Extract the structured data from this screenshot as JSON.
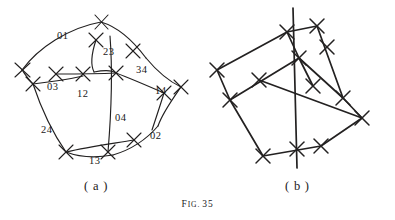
{
  "figure": {
    "caption_prefix": "F",
    "caption_smallcaps": "IG.",
    "caption_number": "35",
    "caption_full": "FIG. 35",
    "background_color": "#ffffff",
    "ink_color": "#222020"
  },
  "panels": [
    {
      "id": "a",
      "subcaption": "( a )",
      "style": "curved-arcs",
      "description": "knot projection drawn with curved arcs and tick-marked crossings",
      "crossing_labels": [
        {
          "text": "01",
          "x": 57,
          "y": 31
        },
        {
          "text": "23",
          "x": 103,
          "y": 47
        },
        {
          "text": "34",
          "x": 136,
          "y": 65
        },
        {
          "text": "03",
          "x": 47,
          "y": 82
        },
        {
          "text": "12",
          "x": 77,
          "y": 89
        },
        {
          "text": "14",
          "x": 155,
          "y": 86
        },
        {
          "text": "04",
          "x": 115,
          "y": 113
        },
        {
          "text": "24",
          "x": 41,
          "y": 125
        },
        {
          "text": "02",
          "x": 150,
          "y": 131
        },
        {
          "text": "13",
          "x": 89,
          "y": 156
        }
      ]
    },
    {
      "id": "b",
      "subcaption": "( b )",
      "style": "straight-segments",
      "description": "same link redrawn with straight line segments and tick-marked crossings",
      "crossing_labels": []
    }
  ]
}
